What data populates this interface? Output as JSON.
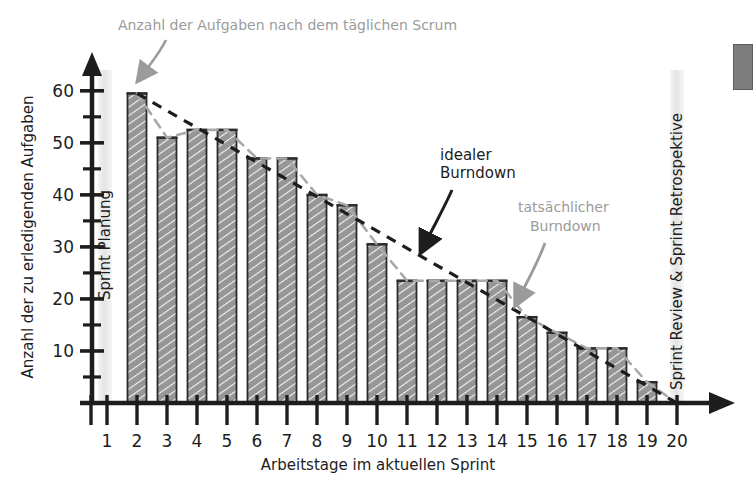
{
  "chart_data": {
    "type": "bar",
    "title": "",
    "xlabel": "Arbeitstage im aktuellen Sprint",
    "ylabel": "Anzahl der zu erledigenden Aufgaben",
    "categories": [
      "1",
      "2",
      "3",
      "4",
      "5",
      "6",
      "7",
      "8",
      "9",
      "10",
      "11",
      "12",
      "13",
      "14",
      "15",
      "16",
      "17",
      "18",
      "19",
      "20"
    ],
    "values": [
      null,
      59.5,
      51,
      52.5,
      52.5,
      47,
      47,
      40,
      38,
      30.5,
      23.5,
      23.5,
      23.5,
      23.5,
      16.5,
      13.5,
      10.5,
      10.5,
      4,
      null
    ],
    "ylim": [
      0,
      64
    ],
    "yticks_major": [
      10,
      20,
      30,
      40,
      50,
      60
    ],
    "yticks_minor": [
      5,
      15,
      25,
      35,
      45,
      55
    ],
    "xlim": [
      1,
      20
    ],
    "grid": false,
    "legend": "none",
    "series": [
      {
        "name": "tatsächlicher Burndown",
        "style": "dashed-line-gray",
        "color": "#a8a8a8",
        "x": [
          2,
          3,
          4,
          5,
          6,
          7,
          8,
          9,
          10,
          11,
          12,
          13,
          14,
          15,
          16,
          17,
          18,
          19,
          20
        ],
        "values": [
          59.5,
          51,
          52.5,
          52.5,
          47,
          47,
          40,
          38,
          30.5,
          23.5,
          23.5,
          23.5,
          23.5,
          16.5,
          13.5,
          10.5,
          10.5,
          4,
          0
        ]
      },
      {
        "name": "idealer Burndown",
        "style": "dashed-line-black",
        "color": "#1d1d1d",
        "x": [
          2,
          20
        ],
        "values": [
          59.5,
          0
        ]
      }
    ],
    "bars": {
      "fill": "#969696",
      "stroke": "#2b2b2b",
      "hatch": "diagonal-white"
    },
    "annotations": [
      {
        "id": "top-annotation",
        "text": "Anzahl der Aufgaben nach dem täglichen Scrum",
        "color": "#9b9b9b",
        "points_to": "bar-day-2-top"
      },
      {
        "id": "ideal-annotation",
        "text_line1": "idealer",
        "text_line2": "Burndown",
        "color": "#1d1d1d",
        "points_to": "ideal-burndown-line"
      },
      {
        "id": "actual-annotation",
        "text_line1": "tatsächlicher",
        "text_line2": "Burndown",
        "color": "#9b9b9b",
        "points_to": "actual-burndown-line"
      }
    ],
    "bands": [
      {
        "id": "sprint-planung-band",
        "label": "Sprint Planung",
        "at_day": 1,
        "color": "#e9e9e9"
      },
      {
        "id": "sprint-review-band",
        "label": "Sprint Review & Sprint Retrospektive",
        "at_day": 20,
        "color": "#e9e9e9"
      }
    ]
  },
  "axes": {
    "y_title": "Anzahl der zu erledigenden Aufgaben",
    "x_title": "Arbeitstage im aktuellen Sprint",
    "y_tick_labels": [
      "10",
      "20",
      "30",
      "40",
      "50",
      "60"
    ],
    "x_tick_labels": [
      "1",
      "2",
      "3",
      "4",
      "5",
      "6",
      "7",
      "8",
      "9",
      "10",
      "11",
      "12",
      "13",
      "14",
      "15",
      "16",
      "17",
      "18",
      "19",
      "20"
    ]
  },
  "labels": {
    "top_annotation": "Anzahl der Aufgaben nach dem täglichen Scrum",
    "ideal_line1": "idealer",
    "ideal_line2": "Burndown",
    "actual_line1": "tatsächlicher",
    "actual_line2": "Burndown",
    "sprint_planung": "Sprint Planung",
    "sprint_review": "Sprint Review & Sprint Retrospektive"
  },
  "colors": {
    "bar_fill": "#969696",
    "bar_stroke": "#2b2b2b",
    "axis": "#1d1d1d",
    "ideal_line": "#1d1d1d",
    "actual_line": "#a8a8a8",
    "annotation_gray": "#9b9b9b",
    "band": "#e9e9e9",
    "background": "#ffffff"
  }
}
